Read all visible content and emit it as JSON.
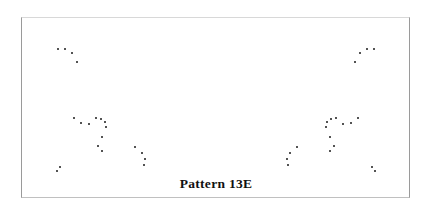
{
  "figure": {
    "caption": "Pattern 13E",
    "background_color": "#ffffff",
    "dot_color": "#1a1a1a",
    "frame_color": "#9a9a9a",
    "dot_count": 36,
    "symmetry": "bilateral mirror symmetry about the vertical mid-line"
  },
  "frame": {
    "x": 21,
    "y": 17,
    "width": 389,
    "height": 181
  },
  "chart_data": {
    "type": "scatter",
    "title": "Pattern 13E",
    "xlabel": "",
    "ylabel": "",
    "xlim": [
      0,
      432
    ],
    "ylim": [
      214,
      0
    ],
    "grid": false,
    "legend": null,
    "marker": "dot",
    "marker_size": 2.4,
    "mirror_axis_x": 216,
    "series": [
      {
        "name": "left-half dots",
        "points": [
          [
            58,
            49
          ],
          [
            65,
            49
          ],
          [
            72,
            53
          ],
          [
            77,
            62
          ],
          [
            74,
            118
          ],
          [
            81,
            123
          ],
          [
            89,
            124
          ],
          [
            96,
            118
          ],
          [
            101,
            119
          ],
          [
            105,
            122
          ],
          [
            106,
            127
          ],
          [
            102,
            137
          ],
          [
            98,
            146
          ],
          [
            102,
            151
          ],
          [
            135,
            147
          ],
          [
            142,
            153
          ],
          [
            145,
            159
          ],
          [
            144,
            165
          ],
          [
            57,
            171
          ],
          [
            60,
            167
          ]
        ]
      },
      {
        "name": "right-half dots",
        "points": [
          [
            374,
            49
          ],
          [
            367,
            49
          ],
          [
            360,
            53
          ],
          [
            355,
            62
          ],
          [
            358,
            118
          ],
          [
            351,
            123
          ],
          [
            343,
            124
          ],
          [
            336,
            118
          ],
          [
            331,
            119
          ],
          [
            327,
            122
          ],
          [
            326,
            127
          ],
          [
            330,
            137
          ],
          [
            334,
            146
          ],
          [
            330,
            151
          ],
          [
            297,
            147
          ],
          [
            290,
            153
          ],
          [
            287,
            159
          ],
          [
            288,
            165
          ],
          [
            375,
            171
          ],
          [
            372,
            167
          ]
        ]
      }
    ]
  }
}
